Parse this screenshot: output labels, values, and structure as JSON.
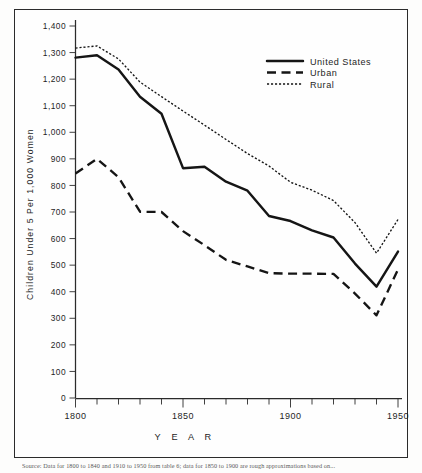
{
  "figure": {
    "plate_background": "#fefefe",
    "frame_color": "#2b2b2b",
    "ink_color": "#151515"
  },
  "caption": {
    "text": "Source: Data for 1800 to 1840 and 1910 to 1950 from table 6; data for 1850 to 1900 are rough approximations based on..."
  },
  "chart_data": {
    "type": "line",
    "title": "",
    "subtitle": "",
    "xlabel": "Y E A R",
    "ylabel": "Children Under 5 Per 1,000 Women",
    "xlim": [
      1800,
      1950
    ],
    "ylim": [
      0,
      1400
    ],
    "grid": false,
    "legend_position": "top-right",
    "x_tick_labels": [
      "1800",
      "1850",
      "1900",
      "1950"
    ],
    "x_major_ticks": [
      1800,
      1850,
      1900,
      1950
    ],
    "x_minor_ticks": [
      1810,
      1820,
      1830,
      1840,
      1860,
      1870,
      1880,
      1890,
      1910,
      1920,
      1930,
      1940
    ],
    "y_tick_labels": [
      "0",
      "100",
      "200",
      "300",
      "400",
      "500",
      "600",
      "700",
      "800",
      "900",
      "1,000",
      "1,100",
      "1,200",
      "1,300",
      "1,400"
    ],
    "y_ticks": [
      0,
      100,
      200,
      300,
      400,
      500,
      600,
      700,
      800,
      900,
      1000,
      1100,
      1200,
      1300,
      1400
    ],
    "x": [
      1800,
      1810,
      1820,
      1830,
      1840,
      1850,
      1860,
      1870,
      1880,
      1890,
      1900,
      1910,
      1920,
      1930,
      1940,
      1950
    ],
    "series": [
      {
        "name": "United States",
        "style": "solid",
        "values": [
          1281,
          1290,
          1236,
          1134,
          1070,
          865,
          870,
          814,
          780,
          685,
          666,
          631,
          604,
          506,
          419,
          551
        ]
      },
      {
        "name": "Urban",
        "style": "dashed",
        "values": [
          845,
          900,
          831,
          701,
          700,
          628,
          575,
          520,
          495,
          470,
          468,
          468,
          467,
          393,
          311,
          484
        ]
      },
      {
        "name": "Rural",
        "style": "dotted",
        "values": [
          1317,
          1325,
          1276,
          1189,
          1134,
          1080,
          1027,
          973,
          920,
          873,
          812,
          782,
          743,
          660,
          545,
          672
        ]
      }
    ]
  },
  "legend": {
    "items": [
      {
        "label": "United States",
        "style": "solid"
      },
      {
        "label": "Urban",
        "style": "dashed"
      },
      {
        "label": "Rural",
        "style": "dotted"
      }
    ]
  }
}
